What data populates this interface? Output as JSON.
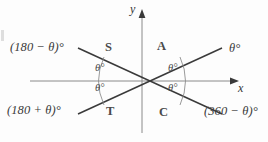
{
  "figure": {
    "background_color": "#fdfdfd",
    "line_color": "#3a3a3a",
    "axis_color": "#8a8a8a",
    "text_color": "#3a3a3a"
  },
  "axes": {
    "y_label": "y",
    "x_label": "x",
    "origin": {
      "x": 142,
      "y": 81
    },
    "x_axis": {
      "from_x": 30,
      "to_x": 235,
      "y": 81,
      "arrow": "right"
    },
    "y_axis": {
      "x": 142,
      "from_y": 12,
      "to_y": 133,
      "arrow": "up"
    }
  },
  "rays": [
    {
      "name": "upper-right-ray",
      "label": "θ°",
      "from": [
        142,
        81
      ],
      "to": [
        224,
        46
      ]
    },
    {
      "name": "upper-left-ray",
      "label": "(180 − θ)°",
      "from": [
        142,
        81
      ],
      "to": [
        60,
        46
      ]
    },
    {
      "name": "lower-left-ray",
      "label": "(180 + θ)°",
      "from": [
        142,
        81
      ],
      "to": [
        60,
        116
      ]
    },
    {
      "name": "lower-right-ray",
      "label": "(360 − θ)°",
      "from": [
        142,
        81
      ],
      "to": [
        224,
        116
      ]
    }
  ],
  "outer_labels": {
    "top_left": "(180 − θ)°",
    "top_right": "θ°",
    "bottom_left": "(180 + θ)°",
    "bottom_right": "(360 − θ)°"
  },
  "quadrant_letters": {
    "upper_left": "S",
    "upper_right": "A",
    "lower_left": "T",
    "lower_right": "C"
  },
  "inner_angle_labels": {
    "upper_left": "θ°",
    "lower_left": "θ°",
    "upper_right": "θ°",
    "lower_right": "θ°"
  },
  "arc_marks": {
    "left": "angle arc spanning upper-left and lower-left angles",
    "right": "angle arc spanning upper-right and lower-right angles"
  }
}
